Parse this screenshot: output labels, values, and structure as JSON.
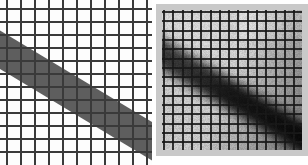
{
  "figure": {
    "caption": "",
    "background_color": "#ffffff",
    "width_px": 308,
    "height_px": 165,
    "panel_count": 2
  },
  "panels": [
    {
      "id": "synthetic",
      "name": "Synthetic grid panel",
      "label": "",
      "position": "left",
      "x_px": 0,
      "y_px": 0,
      "width_px": 152,
      "height_px": 165,
      "background_color": "#fdfdfd",
      "grid": {
        "style": "orthogonal line mesh",
        "vertical_line_count": 11,
        "horizontal_line_count": 12,
        "vertical_spacing_px": 14,
        "horizontal_spacing_px": 13,
        "line_color": "#3a3a3a",
        "line_width_px": 2,
        "minor_line_color": "#7a7a7a"
      },
      "band": {
        "name": "dark diagonal band",
        "fill_color": "#5e5e5e",
        "edge_color": "#6a6a6a",
        "orientation": "descending left-to-right",
        "angle_degrees": 31,
        "thickness_px": 33,
        "entry_y_px": 27,
        "exit_y_px": 125,
        "blur": "none"
      }
    },
    {
      "id": "measured",
      "name": "Measured grid panel",
      "label": "",
      "position": "right",
      "x_px": 156,
      "y_px": 4,
      "width_px": 152,
      "height_px": 152,
      "background_color": "#d8d8d8",
      "border_color": "#c9c9c9",
      "border_px": 6,
      "grid": {
        "style": "photographed wire mesh",
        "vertical_line_count": 15,
        "horizontal_line_count": 15,
        "vertical_spacing_px": 9.3,
        "horizontal_spacing_px": 9.3,
        "line_color": "#1c1c1c",
        "line_width_px": 2
      },
      "band": {
        "name": "blurred dark diagonal band",
        "fill_color": "#2b2b2b",
        "core_color": "#141414",
        "orientation": "descending left-to-right",
        "angle_degrees": 31,
        "thickness_px": 30,
        "blur_radius_px": 5
      },
      "artifacts": {
        "noise": "film grain speckle",
        "vignette": "darker toward lower-right corner",
        "highlight": "brighter patch at top-right"
      }
    }
  ],
  "colors": {
    "page_background": "#ffffff",
    "grid_dark": "#3a3a3a",
    "grid_light": "#7a7a7a",
    "band_synthetic": "#5e5e5e",
    "band_measured": "#2b2b2b",
    "panel_measured_bg": "#d8d8d8",
    "panel_measured_border": "#c9c9c9"
  }
}
